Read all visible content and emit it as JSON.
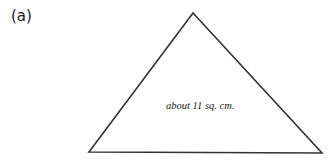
{
  "figure": {
    "label": "(a)",
    "shape": "triangle",
    "vertices": [
      [
        193,
        13
      ],
      [
        89,
        152
      ],
      [
        322,
        153
      ]
    ],
    "stroke_color": "#333333",
    "area_label": "about 11 sq. cm."
  }
}
